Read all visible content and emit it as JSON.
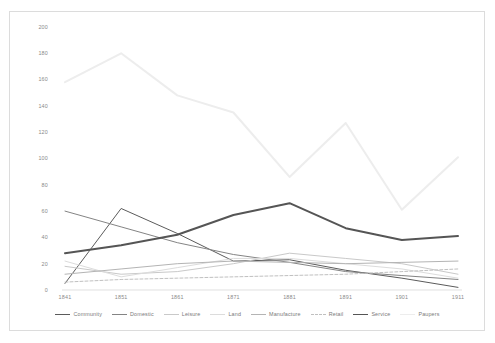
{
  "chart_data": {
    "type": "line",
    "title": "",
    "xlabel": "",
    "ylabel": "",
    "categories": [
      "1841",
      "1851",
      "1861",
      "1871",
      "1881",
      "1891",
      "1901",
      "1911"
    ],
    "x": [
      1841,
      1851,
      1861,
      1871,
      1881,
      1891,
      1901,
      1911
    ],
    "ylim": [
      0,
      200
    ],
    "yticks": [
      0,
      20,
      40,
      60,
      80,
      100,
      120,
      140,
      160,
      180,
      200
    ],
    "ytick_labels": [
      "0",
      "20",
      "40",
      "60",
      "80",
      "100",
      "120",
      "140",
      "160",
      "180",
      "200"
    ],
    "grid": false,
    "legend_position": "bottom",
    "series": [
      {
        "name": "Community",
        "color": "#5b5b5b",
        "width": 1.0,
        "dash": "none",
        "values": [
          5,
          62,
          43,
          22,
          23,
          15,
          9,
          2
        ]
      },
      {
        "name": "Domestic",
        "color": "#848484",
        "width": 1.0,
        "dash": "none",
        "values": [
          60,
          48,
          36,
          27,
          21,
          14,
          11,
          8
        ]
      },
      {
        "name": "Leisure",
        "color": "#c9c9c9",
        "width": 1.0,
        "dash": "none",
        "values": [
          18,
          12,
          14,
          20,
          28,
          24,
          20,
          12
        ]
      },
      {
        "name": "Land",
        "color": "#dcdcdc",
        "width": 1.0,
        "dash": "none",
        "values": [
          22,
          10,
          17,
          24,
          24,
          20,
          16,
          9
        ]
      },
      {
        "name": "Manufacture",
        "color": "#b4b4b4",
        "width": 1.0,
        "dash": "none",
        "values": [
          12,
          16,
          20,
          22,
          21,
          20,
          21,
          22
        ]
      },
      {
        "name": "Retail",
        "color": "#c0c0c0",
        "width": 1.0,
        "dash": "dashed",
        "values": [
          6,
          8,
          9,
          10,
          11,
          12,
          14,
          16
        ]
      },
      {
        "name": "Service",
        "color": "#555555",
        "width": 2.0,
        "dash": "none",
        "values": [
          28,
          34,
          42,
          57,
          66,
          47,
          38,
          41
        ]
      },
      {
        "name": "Paupers",
        "color": "#ededed",
        "width": 2.0,
        "dash": "none",
        "values": [
          158,
          180,
          148,
          135,
          86,
          127,
          61,
          101
        ]
      }
    ]
  },
  "axis": {
    "y_tick_labels": [
      "200",
      "180",
      "160",
      "140",
      "120",
      "100",
      "80",
      "60",
      "40",
      "20",
      "0"
    ],
    "x_tick_labels": [
      "1841",
      "1851",
      "1861",
      "1871",
      "1881",
      "1891",
      "1901",
      "1911"
    ]
  },
  "legend": {
    "items": [
      {
        "label": "Community"
      },
      {
        "label": "Domestic"
      },
      {
        "label": "Leisure"
      },
      {
        "label": "Land"
      },
      {
        "label": "Manufacture"
      },
      {
        "label": "Retail"
      },
      {
        "label": "Service"
      },
      {
        "label": "Paupers"
      }
    ]
  }
}
